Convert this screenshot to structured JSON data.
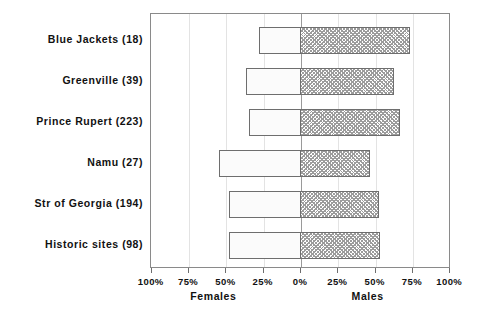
{
  "chart_data": {
    "type": "bar",
    "orientation": "horizontal",
    "subtype": "diverging-population-pyramid",
    "title": "",
    "subtitle": "",
    "xlabel": "",
    "ylabel": "",
    "grid": true,
    "legend_position": "none",
    "categories": [
      "Blue Jackets (18)",
      "Greenville (39)",
      "Prince Rupert (223)",
      "Namu (27)",
      "Str of Georgia (194)",
      "Historic sites (98)"
    ],
    "category_counts": [
      18,
      39,
      223,
      27,
      194,
      98
    ],
    "series": [
      {
        "name": "Females",
        "direction": "left",
        "fill": "open",
        "values": [
          28,
          37,
          35,
          55,
          48,
          48
        ]
      },
      {
        "name": "Males",
        "direction": "right",
        "fill": "crosshatch",
        "values": [
          73,
          62,
          66,
          46,
          52,
          53
        ]
      }
    ],
    "x_ticks": [
      {
        "label": "100%",
        "value": -100
      },
      {
        "label": "75%",
        "value": -75
      },
      {
        "label": "50%",
        "value": -50
      },
      {
        "label": "25%",
        "value": -25
      },
      {
        "label": "0%",
        "value": 0
      },
      {
        "label": "25%",
        "value": 25
      },
      {
        "label": "50%",
        "value": 50
      },
      {
        "label": "75%",
        "value": 75
      },
      {
        "label": "100%",
        "value": 100
      }
    ],
    "xlim": [
      -100,
      100
    ],
    "axis_titles": {
      "left": "Females",
      "right": "Males"
    },
    "colors": {
      "frame": "#8a8a8a",
      "bar_outline": "#6e6e6e",
      "female_fill": "#fbfbfb",
      "male_hatch": "#9c9c9c",
      "gridline": "#e3e3e3",
      "centerline": "#9a9a9a",
      "text": "#111111",
      "background": "#ffffff"
    }
  }
}
